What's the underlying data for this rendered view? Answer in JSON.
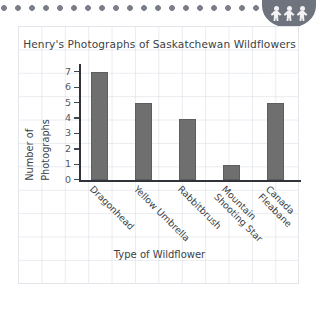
{
  "decor": {
    "dot_strip_color": "#7b7f8a",
    "badge_color": "#6f737d",
    "badge_icon": "people-group-icon",
    "badge_figure_count": 3
  },
  "card": {
    "background": "#ffffff",
    "border_color": "#e3e5ea",
    "grid_color": "#c6ced8"
  },
  "chart_data": {
    "type": "bar",
    "title": "Henry's Photographs of Saskatchewan Wildflowers",
    "xlabel": "Type of Wildflower",
    "ylabel": "Number of Photographs",
    "ylabel_line1": "Number of",
    "ylabel_line2": "Photographs",
    "categories": [
      "Dragonhead",
      "Yellow Umbrella",
      "Rabbitbrush",
      "Mountain Shooting Star",
      "Canada Fleabane"
    ],
    "category_lines": [
      [
        "Dragonhead"
      ],
      [
        "Yellow Umbrella"
      ],
      [
        "Rabbitbrush"
      ],
      [
        "Mountain",
        "Shooting Star"
      ],
      [
        "Canada",
        "Fleabane"
      ]
    ],
    "values": [
      7,
      5,
      4,
      1,
      5
    ],
    "ylim": [
      0,
      7
    ],
    "yticks": [
      0,
      1,
      2,
      3,
      4,
      5,
      6,
      7
    ],
    "grid": true,
    "legend": null,
    "bar_color": "#6f6f6f",
    "axis_color": "#2f3238"
  }
}
